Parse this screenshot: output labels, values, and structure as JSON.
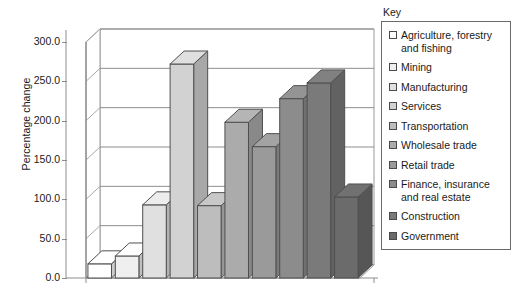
{
  "chart_data": {
    "type": "bar",
    "title": "",
    "subtitle": "",
    "xlabel": "",
    "ylabel": "Percentage change",
    "ylim": [
      0,
      300
    ],
    "ytick_labels": [
      "300.0",
      "250.0",
      "200.0",
      "150.0",
      "100.0",
      "50.0",
      "0.0"
    ],
    "ytick_values": [
      300,
      250,
      200,
      150,
      100,
      50,
      0
    ],
    "grid": true,
    "three_d": true,
    "legend_position": "right",
    "legend_title": "Key",
    "categories": [
      "Agriculture, forestry and fishing",
      "Mining",
      "Manufacturing",
      "Services",
      "Transportation",
      "Wholesale trade",
      "Retail trade",
      "Finance, insurance and real estate",
      "Construction",
      "Government"
    ],
    "values": [
      18,
      28,
      93,
      272,
      92,
      198,
      167,
      228,
      248,
      103
    ],
    "colors": [
      "#ffffff",
      "#efefef",
      "#e0e0e0",
      "#d2d2d2",
      "#bdbdbd",
      "#ababab",
      "#9a9a9a",
      "#8c8c8c",
      "#7a7a7a",
      "#6b6b6b"
    ]
  },
  "legend": {
    "title": "Key",
    "items": [
      {
        "label": "Agriculture, forestry and fishing",
        "color": "#ffffff"
      },
      {
        "label": "Mining",
        "color": "#efefef"
      },
      {
        "label": "Manufacturing",
        "color": "#e0e0e0"
      },
      {
        "label": "Services",
        "color": "#d2d2d2"
      },
      {
        "label": "Transportation",
        "color": "#bdbdbd"
      },
      {
        "label": "Wholesale trade",
        "color": "#ababab"
      },
      {
        "label": "Retail trade",
        "color": "#9a9a9a"
      },
      {
        "label": "Finance, insurance and real estate",
        "color": "#8c8c8c"
      },
      {
        "label": "Construction",
        "color": "#7a7a7a"
      },
      {
        "label": "Government",
        "color": "#6b6b6b"
      }
    ]
  },
  "axis": {
    "y_title": "Percentage change"
  }
}
